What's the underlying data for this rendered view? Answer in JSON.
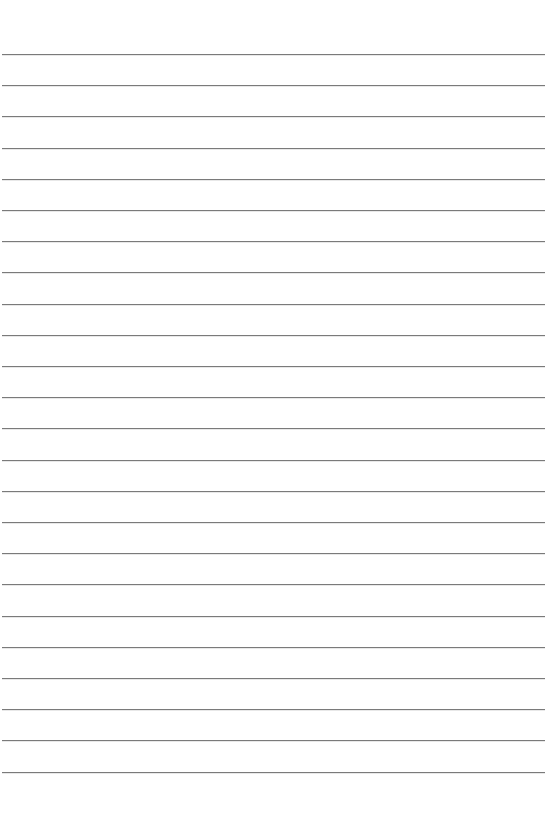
{
  "sheet": {
    "type": "lined-paper",
    "background": "#ffffff",
    "line_color": "#7a7a7a",
    "line_count": 24,
    "first_line_y": 54,
    "line_spacing": 31.2
  }
}
